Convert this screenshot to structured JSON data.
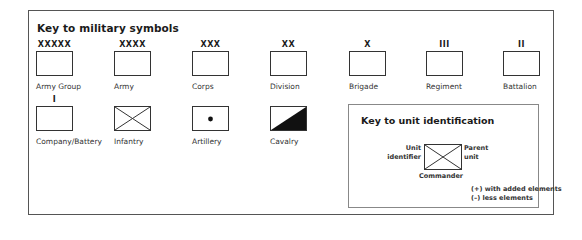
{
  "title": "Key to military symbols",
  "symbols": [
    {
      "label": "Army Group",
      "mark": "XXXXX",
      "icon": "army-group-icon"
    },
    {
      "label": "Army",
      "mark": "XXXX",
      "icon": "army-icon"
    },
    {
      "label": "Corps",
      "mark": "XXX",
      "icon": "corps-icon"
    },
    {
      "label": "Division",
      "mark": "XX",
      "icon": "division-icon"
    },
    {
      "label": "Brigade",
      "mark": "X",
      "icon": "brigade-icon"
    },
    {
      "label": "Regiment",
      "mark": "III",
      "icon": "regiment-icon"
    },
    {
      "label": "Battalion",
      "mark": "II",
      "icon": "battalion-icon"
    },
    {
      "label": "Company/Battery",
      "mark": "I",
      "icon": "company-battery-icon"
    },
    {
      "label": "Infantry",
      "mark": "",
      "icon": "infantry-icon"
    },
    {
      "label": "Artillery",
      "mark": "",
      "icon": "artillery-icon"
    },
    {
      "label": "Cavalry",
      "mark": "",
      "icon": "cavalry-icon"
    }
  ],
  "unit_key": {
    "title": "Key to unit identification",
    "unit_identifier_line1": "Unit",
    "unit_identifier_line2": "identifier",
    "parent_unit_line1": "Parent",
    "parent_unit_line2": "unit",
    "commander": "Commander",
    "note_plus": "(+) with added elements",
    "note_minus": "(–) less elements"
  }
}
